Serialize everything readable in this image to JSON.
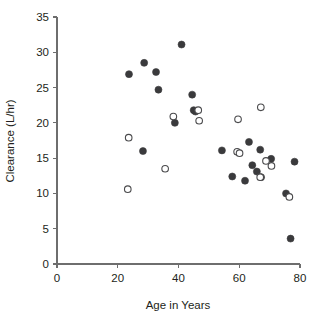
{
  "chart_data": {
    "type": "scatter",
    "title": "",
    "xlabel": "Age in Years",
    "ylabel": "Clearance (L/hr)",
    "xlim": [
      0,
      80
    ],
    "ylim": [
      0,
      35
    ],
    "xticks": [
      0,
      20,
      40,
      60,
      80
    ],
    "yticks": [
      0,
      5,
      10,
      15,
      20,
      25,
      30,
      35
    ],
    "grid": false,
    "legend": "none",
    "series": [
      {
        "name": "filled",
        "marker": "filled-circle",
        "color": "#3a3a3c",
        "points": [
          [
            23.7,
            26.9
          ],
          [
            28.7,
            28.5
          ],
          [
            32.6,
            27.2
          ],
          [
            33.4,
            24.7
          ],
          [
            41.0,
            31.1
          ],
          [
            44.5,
            24.0
          ],
          [
            45.0,
            21.8
          ],
          [
            45.6,
            21.6
          ],
          [
            38.8,
            20.0
          ],
          [
            28.3,
            16.0
          ],
          [
            54.3,
            16.1
          ],
          [
            63.2,
            17.3
          ],
          [
            66.9,
            16.2
          ],
          [
            70.5,
            14.9
          ],
          [
            64.3,
            14.0
          ],
          [
            65.8,
            13.1
          ],
          [
            57.7,
            12.4
          ],
          [
            61.9,
            11.8
          ],
          [
            75.4,
            10.0
          ],
          [
            78.2,
            14.5
          ],
          [
            76.9,
            3.6
          ],
          [
            67.2,
            12.3
          ]
        ]
      },
      {
        "name": "open",
        "marker": "open-circle",
        "color": "#4a4a4c",
        "points": [
          [
            23.6,
            17.9
          ],
          [
            23.3,
            10.6
          ],
          [
            35.6,
            13.5
          ],
          [
            38.3,
            20.9
          ],
          [
            46.5,
            21.8
          ],
          [
            46.8,
            20.3
          ],
          [
            59.3,
            15.9
          ],
          [
            60.1,
            15.7
          ],
          [
            59.6,
            20.5
          ],
          [
            67.1,
            22.2
          ],
          [
            68.8,
            14.6
          ],
          [
            70.6,
            13.9
          ],
          [
            66.9,
            12.3
          ],
          [
            76.5,
            9.5
          ]
        ]
      }
    ]
  },
  "axes": {
    "x_tick_labels": [
      "0",
      "20",
      "40",
      "60",
      "80"
    ],
    "y_tick_labels": [
      "0",
      "5",
      "10",
      "15",
      "20",
      "25",
      "30",
      "35"
    ],
    "x_axis_title": "Age in Years",
    "y_axis_title": "Clearance (L/hr)"
  },
  "colors": {
    "axis": "#6e6e6e",
    "text": "#231f20",
    "filled_marker": "#3a3a3c",
    "open_marker": "#4a4a4c",
    "background": "#ffffff"
  }
}
